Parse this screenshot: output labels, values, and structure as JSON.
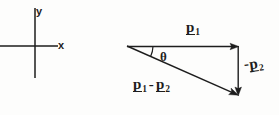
{
  "figure": {
    "type": "vector-diagram",
    "background_color": "#fdfdfc",
    "ink_color": "#1d1d1d"
  },
  "axes": {
    "x_label": "x",
    "y_label": "y",
    "origin": {
      "x": 35,
      "y": 46
    },
    "x_axis": {
      "x1": 0,
      "y1": 46,
      "x2": 58,
      "y2": 46
    },
    "y_axis": {
      "x1": 35,
      "y1": 8,
      "x2": 35,
      "y2": 78
    }
  },
  "triangle": {
    "vertices": {
      "left": {
        "x": 127,
        "y": 46
      },
      "top_right": {
        "x": 238,
        "y": 46
      },
      "bottom_right": {
        "x": 238,
        "y": 95
      }
    },
    "angle_symbol": "θ",
    "angle_name": "theta"
  },
  "vectors": [
    {
      "name": "p1",
      "symbol": "p",
      "subscript": "1",
      "sign": "",
      "direction": "right",
      "from": {
        "x": 127,
        "y": 46
      },
      "to": {
        "x": 238,
        "y": 46
      }
    },
    {
      "name": "negative-p2",
      "symbol": "p",
      "subscript": "2",
      "sign": "-",
      "direction": "down",
      "from": {
        "x": 238,
        "y": 46
      },
      "to": {
        "x": 238,
        "y": 95
      }
    },
    {
      "name": "p1-minus-p2",
      "symbol": "p",
      "subscript_first": "1",
      "subscript_second": "2",
      "operator": "-",
      "direction": "down-right",
      "from": {
        "x": 127,
        "y": 46
      },
      "to": {
        "x": 238,
        "y": 95
      }
    }
  ],
  "labels": {
    "p1": {
      "sign": "",
      "letter": "p",
      "sub": "1"
    },
    "neg_p2": {
      "sign": "-",
      "letter": "p",
      "sub": "2"
    },
    "p1_minus_p2": {
      "letter_a": "p",
      "sub_a": "1",
      "operator": "-",
      "letter_b": "p",
      "sub_b": "2"
    },
    "theta": "θ"
  }
}
